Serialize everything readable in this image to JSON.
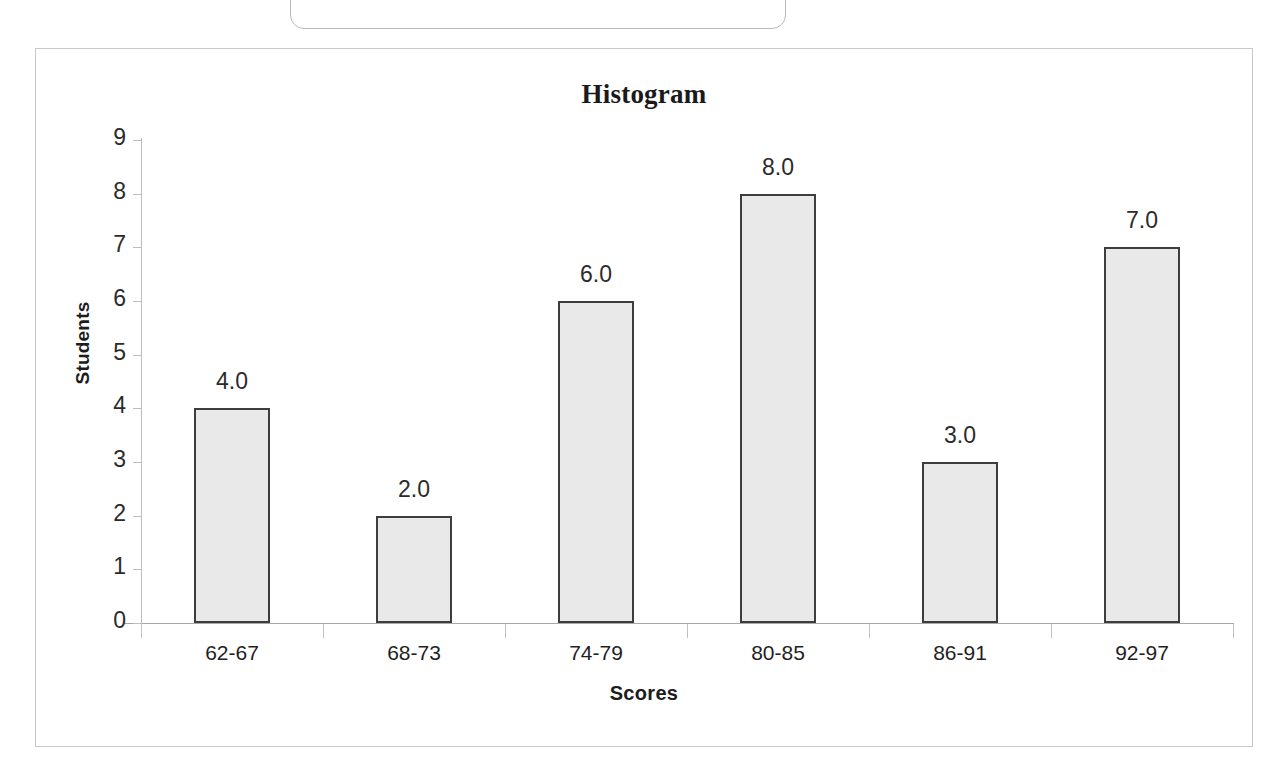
{
  "page": {
    "background_color": "#ffffff",
    "clipped_top_box": {
      "shape": "rounded-rectangle",
      "border_color": "#b9b9b9"
    }
  },
  "chart_frame": {
    "border_color": "#c9c9c9"
  },
  "chart_data": {
    "type": "bar",
    "title": "Histogram",
    "xlabel": "Scores",
    "ylabel": "Students",
    "categories": [
      "62-67",
      "68-73",
      "74-79",
      "80-85",
      "86-91",
      "92-97"
    ],
    "values": [
      4,
      2,
      6,
      8,
      3,
      7
    ],
    "data_labels": [
      "4.0",
      "2.0",
      "6.0",
      "8.0",
      "3.0",
      "7.0"
    ],
    "ylim": [
      0,
      9
    ],
    "ytick_labels": [
      "9",
      "8",
      "7",
      "6",
      "5",
      "4",
      "3",
      "2",
      "1",
      "0"
    ],
    "ytick_values": [
      9,
      8,
      7,
      6,
      5,
      4,
      3,
      2,
      1,
      0
    ],
    "grid": false,
    "legend": false,
    "legend_position": "none",
    "bar_fill_color": "#e9e9e9",
    "bar_border_color": "#3d3d3d",
    "axis_color": "#bdbdbd",
    "text_color": "#2b2b2b"
  }
}
